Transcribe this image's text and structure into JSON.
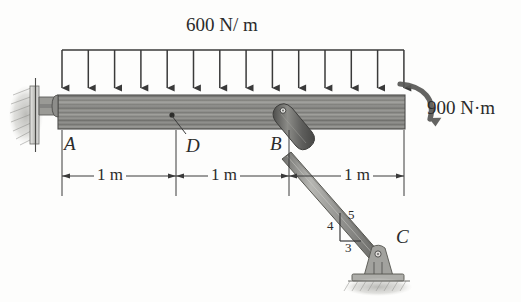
{
  "figure": {
    "type": "engineering-free-body-diagram",
    "background_color": "#fdfdfc",
    "line_color": "#3a3a3a",
    "beam_color": "#8a8a88",
    "strut_color": "#9c9c98",
    "clevis_color": "#6d6d6b"
  },
  "loads": {
    "distributed": {
      "label": "600 N/ m",
      "magnitude": "600",
      "unit": "N/m",
      "direction": "downward",
      "arrow_count": 14,
      "span_start_m": 0,
      "span_end_m": 3
    },
    "couple": {
      "label": "900 N·m",
      "magnitude": "900",
      "unit": "N·m",
      "sense": "clockwise",
      "location": "right-end-of-beam"
    }
  },
  "points": [
    {
      "name": "A",
      "label": "A",
      "type": "pin-support-wall",
      "x_m": 0
    },
    {
      "name": "D",
      "label": "D",
      "type": "point-on-beam",
      "x_m": 1
    },
    {
      "name": "B",
      "label": "B",
      "type": "pin-strut-connection",
      "x_m": 2
    },
    {
      "name": "C",
      "label": "C",
      "type": "pin-support-ground"
    }
  ],
  "dimensions": [
    {
      "label": "1 m",
      "from": "A",
      "to": "D"
    },
    {
      "label": "1 m",
      "from": "D",
      "to": "B"
    },
    {
      "label": "1 m",
      "from": "B",
      "to": "beam-right-end"
    }
  ],
  "slope_triangle": {
    "vertical": "4",
    "horizontal": "3",
    "hypotenuse": "5",
    "member": "strut-BC"
  }
}
